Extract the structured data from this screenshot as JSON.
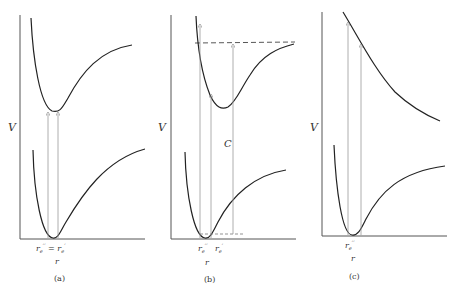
{
  "figure": {
    "panels": [
      {
        "id": "a",
        "caption": "(a)",
        "y_axis_label": "V",
        "x_axis_label": "r",
        "x_tick_label": "r_e'' = r_e'",
        "x_tick_main": "r",
        "upper_curve": "bound excited-state potential, minimum directly above ground-state minimum",
        "lower_curve": "ground-state potential well",
        "transitions": 2
      },
      {
        "id": "b",
        "caption": "(b)",
        "y_axis_label": "V",
        "x_axis_label": "r",
        "x_tick_labels": [
          "r_e''",
          "r_e'"
        ],
        "annotation": "C",
        "upper_curve": "bound excited-state potential, minimum displaced to larger r",
        "lower_curve": "ground-state potential well",
        "dissociation_line": "dashed",
        "transitions": 3
      },
      {
        "id": "c",
        "caption": "(c)",
        "y_axis_label": "V",
        "x_axis_label": "r",
        "x_tick_labels": [
          "r_e''"
        ],
        "upper_curve": "repulsive (unbound) excited-state potential",
        "lower_curve": "ground-state potential well",
        "transitions": 2
      }
    ]
  }
}
